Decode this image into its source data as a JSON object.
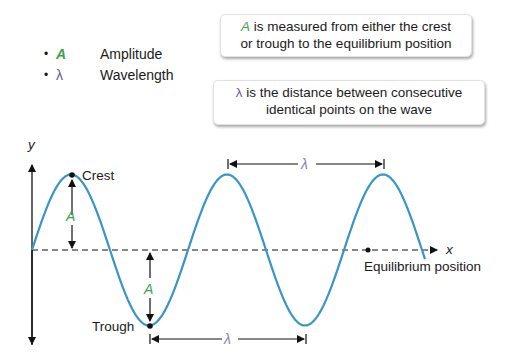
{
  "legend": {
    "items": [
      {
        "bullet": "•",
        "symbol": "A",
        "label": "Amplitude",
        "color": "#3fa34d"
      },
      {
        "bullet": "•",
        "symbol": "λ",
        "label": "Wavelength",
        "color": "#6a5a9c"
      }
    ]
  },
  "notes": {
    "amplitude": {
      "symbol": "A",
      "line1_rest": " is measured from either the crest",
      "line2": "or trough to the equilibrium position"
    },
    "wavelength": {
      "symbol": "λ",
      "line1_rest": " is the distance between consecutive",
      "line2": "identical points on the wave"
    }
  },
  "diagram": {
    "y_axis_label": "y",
    "x_axis_label": "x",
    "crest_label": "Crest",
    "trough_label": "Trough",
    "equilibrium_label": "Equilibrium position",
    "amplitude_symbol": "A",
    "wavelength_symbol": "λ",
    "wave_color": "#3a95c4",
    "amplitude_color": "#3fa34d",
    "wavelength_color": "#8a7bb5"
  }
}
